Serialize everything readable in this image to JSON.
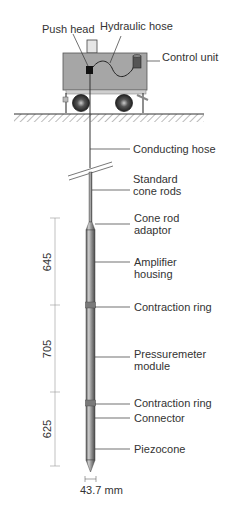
{
  "labels": {
    "push_head": "Push head",
    "hydraulic_hose": "Hydraulic hose",
    "control_unit": "Control unit",
    "conducting_hose": "Conducting hose",
    "standard_cone_rods_1": "Standard",
    "standard_cone_rods_2": "cone rods",
    "cone_rod_adaptor_1": "Cone rod",
    "cone_rod_adaptor_2": "adaptor",
    "amplifier_housing_1": "Amplifier",
    "amplifier_housing_2": "housing",
    "contraction_ring_upper": "Contraction ring",
    "pressuremeter_module_1": "Pressuremeter",
    "pressuremeter_module_2": "module",
    "contraction_ring_lower": "Contraction ring",
    "connector": "Connector",
    "piezocone": "Piezocone"
  },
  "dimensions": {
    "upper": "645",
    "middle": "705",
    "lower": "625",
    "diameter": "43.7 mm"
  },
  "colors": {
    "truck_body": "#a6a6a6",
    "rod": "#8c8c8c",
    "ring": "#7a7a7a",
    "line": "#333333"
  }
}
